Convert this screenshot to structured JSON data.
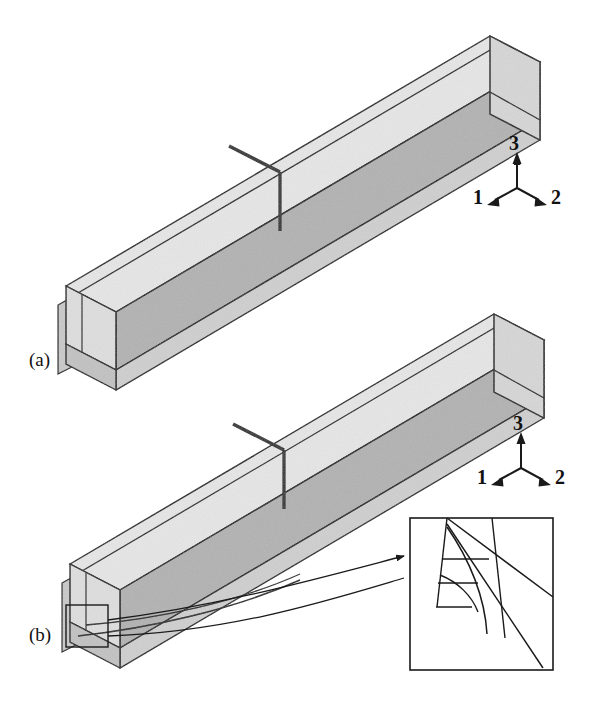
{
  "figure": {
    "kind": "technical-line-diagram",
    "background_color": "#ffffff",
    "line_color": "#1a1a1a",
    "panels": [
      {
        "id": "a",
        "label": "(a)",
        "caption_text": "(a)",
        "state": "intact beam with transverse through-thickness crack"
      },
      {
        "id": "b",
        "label": "(b)",
        "caption_text": "(b)",
        "state": "beam with delamination crack growth and magnified corner detail"
      }
    ],
    "axis_triads": [
      {
        "panel": "a",
        "labels": {
          "up": "3",
          "left": "1",
          "right": "2"
        }
      },
      {
        "panel": "b",
        "labels": {
          "up": "3",
          "left": "1",
          "right": "2"
        }
      }
    ],
    "colors": {
      "face_top_light": "#e6e6e6",
      "face_top_mid": "#dadada",
      "face_side_dark": "#b2b2b2",
      "face_side_mid": "#c4c4c4",
      "face_end_light": "#dedede",
      "face_end_dark": "#bdbdbd",
      "outline": "#1a1a1a",
      "crack_dark": "#2b2b2b",
      "inset_fill": "#ffffff"
    },
    "inset": {
      "name": "magnified-corner-detail",
      "shows": "curved delamination front at beam corner",
      "border_color": "#1a1a1a"
    },
    "markers": {
      "roi_box": "square region-of-interest marker at lower-left end of beam b",
      "leader_arrow": "arrow from region-of-interest box to magnified inset"
    }
  }
}
